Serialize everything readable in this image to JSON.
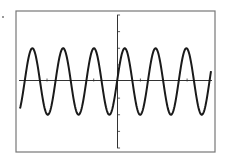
{
  "chart_data": {
    "type": "line",
    "title": "",
    "xlabel": "",
    "ylabel": "",
    "grid": false,
    "legend": null,
    "function": "sinusoid",
    "series": [
      {
        "name": "y = A sin(kx)",
        "amplitude": 2,
        "cycles_visible": 6.2,
        "phase": "rising zero-crossing at origin"
      }
    ],
    "xlim": [
      -6.3,
      6.1
    ],
    "ylim": [
      -4,
      4
    ],
    "x_ticks": [
      -4.5,
      -1.5,
      1.5,
      4.5
    ],
    "y_ticks": [
      -4,
      -3,
      -2,
      -1,
      1,
      2,
      3,
      4
    ],
    "peaks_y": 2,
    "troughs_y": -2
  },
  "colors": {
    "curve": "#1a1a1a",
    "axes": "#333333",
    "frame": "#777777",
    "background": "#ffffff"
  }
}
